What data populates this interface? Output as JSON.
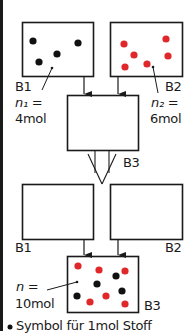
{
  "colors": {
    "line": "#1a1a1a",
    "black_particle": "#111111",
    "red_particle": "#e0282a",
    "background": "#ffffff"
  },
  "diagram": {
    "vessels_before": [
      {
        "label": "B1",
        "amount_label": "n₁ =",
        "amount_value": "4mol",
        "particles": [
          {
            "x": 33,
            "y": 41,
            "c": "black"
          },
          {
            "x": 78,
            "y": 43,
            "c": "black"
          },
          {
            "x": 57,
            "y": 54,
            "c": "black"
          },
          {
            "x": 39,
            "y": 62,
            "c": "black"
          }
        ]
      },
      {
        "label": "B2",
        "amount_label": "n₂ =",
        "amount_value": "6mol",
        "particles": [
          {
            "x": 124,
            "y": 44,
            "c": "red"
          },
          {
            "x": 166,
            "y": 39,
            "c": "red"
          },
          {
            "x": 134,
            "y": 55,
            "c": "red"
          },
          {
            "x": 168,
            "y": 56,
            "c": "red"
          },
          {
            "x": 125,
            "y": 67,
            "c": "red"
          },
          {
            "x": 147,
            "y": 64,
            "c": "red"
          }
        ]
      }
    ],
    "mixing_vessel_label": "B3",
    "vessels_after": [
      {
        "label": "B1"
      },
      {
        "label": "B2"
      }
    ],
    "result_vessel": {
      "label": "B3",
      "amount_label": "n =",
      "amount_value": "10mol",
      "particles": [
        {
          "x": 78,
          "y": 266,
          "c": "red"
        },
        {
          "x": 99,
          "y": 270,
          "c": "red"
        },
        {
          "x": 116,
          "y": 276,
          "c": "black"
        },
        {
          "x": 125,
          "y": 271,
          "c": "red"
        },
        {
          "x": 97,
          "y": 284,
          "c": "black"
        },
        {
          "x": 122,
          "y": 291,
          "c": "black"
        },
        {
          "x": 77,
          "y": 296,
          "c": "black"
        },
        {
          "x": 106,
          "y": 296,
          "c": "red"
        },
        {
          "x": 90,
          "y": 302,
          "c": "red"
        },
        {
          "x": 125,
          "y": 304,
          "c": "red"
        }
      ]
    },
    "legend": {
      "bullet": "•",
      "text": "Symbol für 1mol Stoff"
    }
  }
}
